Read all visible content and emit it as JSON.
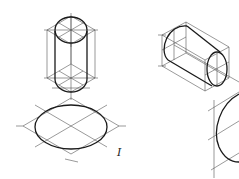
{
  "figure": {
    "type": "isometric-construction-sketch",
    "background": "#ffffff",
    "line_color": "#1a1a1a",
    "construction_color": "#555555",
    "views": [
      {
        "name": "vertical-cylinder",
        "description": "Cylinder with vertical axis inside rhombic prism construction"
      },
      {
        "name": "horizontal-cylinder",
        "description": "Cylinder with axis along isometric x-direction inside prism construction"
      },
      {
        "name": "ellipse-in-rhombus",
        "description": "Isometric circle (ellipse) inscribed in rhombus with center lines",
        "label": "I"
      },
      {
        "name": "partial-ellipse-side-view",
        "description": "Partial ellipse in vertical plane, cropped at right edge"
      }
    ]
  },
  "labels": {
    "view_numeral": "I"
  }
}
